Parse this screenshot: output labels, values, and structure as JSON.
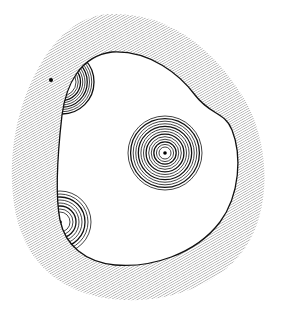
{
  "diagram": {
    "colors": {
      "background": "#ffffff",
      "hatch": "#9a9a9a",
      "line": "#111111"
    },
    "outer_boundary": {
      "fill": "hatched",
      "path": "M 110 14 C 170 12, 215 50, 245 100 C 268 140, 272 200, 250 240 C 225 285, 170 302, 125 300 C 70 298, 28 270, 16 215 C 6 165, 14 110, 40 65 C 60 30, 85 15, 110 14 Z"
    },
    "inner_boundary": {
      "path": "M 112 52 C 150 50, 180 75, 195 95 C 210 115, 225 112, 232 130 C 242 155, 240 195, 220 222 C 195 255, 150 268, 115 265 C 85 262, 65 245, 60 220 C 55 195, 58 150, 62 115 C 66 85, 80 56, 112 52 Z"
    },
    "points": [
      {
        "label": "isolated-dot",
        "x": 51,
        "y": 80,
        "r": 2
      }
    ],
    "circle_sources": [
      {
        "label": "central-source",
        "cx": 165,
        "cy": 153,
        "rings": 13,
        "r_min": 6,
        "r_max": 37,
        "center_dot": true
      },
      {
        "label": "upper-left-source",
        "cx": 62,
        "cy": 82,
        "rings": 9,
        "r_min": 14,
        "r_max": 32,
        "center_dot": false,
        "clipped_to_inner": true
      },
      {
        "label": "lower-left-source",
        "cx": 60,
        "cy": 222,
        "rings": 8,
        "r_min": 10,
        "r_max": 31,
        "center_dot": true,
        "clipped_to_inner": true
      }
    ]
  }
}
